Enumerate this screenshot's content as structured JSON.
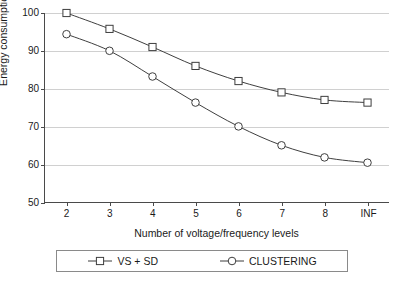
{
  "chart_data": {
    "type": "line",
    "title": "",
    "xlabel": "Number of voltage/frequency levels",
    "ylabel": "Energy consumption",
    "categories": [
      "2",
      "3",
      "4",
      "5",
      "6",
      "7",
      "8",
      "INF"
    ],
    "ylim": [
      50,
      100
    ],
    "yticks": [
      50,
      60,
      70,
      80,
      90,
      100
    ],
    "grid": true,
    "legend_position": "bottom",
    "series": [
      {
        "name": "VS + SD",
        "marker": "open-square",
        "color": "#3d3d3d",
        "values": [
          100,
          95.8,
          91,
          86,
          82,
          79,
          77,
          76.3
        ]
      },
      {
        "name": "CLUSTERING",
        "marker": "open-circle",
        "color": "#3d3d3d",
        "values": [
          94.4,
          90,
          83.2,
          76.3,
          70,
          65,
          61.8,
          60.4
        ]
      }
    ]
  },
  "axis": {
    "y_tick_labels": [
      "100",
      "90",
      "80",
      "70",
      "60",
      "50"
    ],
    "x_tick_labels": [
      "2",
      "3",
      "4",
      "5",
      "6",
      "7",
      "8",
      "INF"
    ],
    "y_title": "Energy consumption",
    "x_title": "Number of voltage/frequency levels"
  },
  "legend": {
    "entries": [
      {
        "label": "VS + SD",
        "marker": "open-square"
      },
      {
        "label": "CLUSTERING",
        "marker": "open-circle"
      }
    ]
  },
  "caption": {
    "text": ""
  },
  "colors": {
    "line": "#3d3d3d",
    "axis": "#4a4a4a",
    "grid": "#d0d0d0",
    "background": "#ffffff"
  }
}
